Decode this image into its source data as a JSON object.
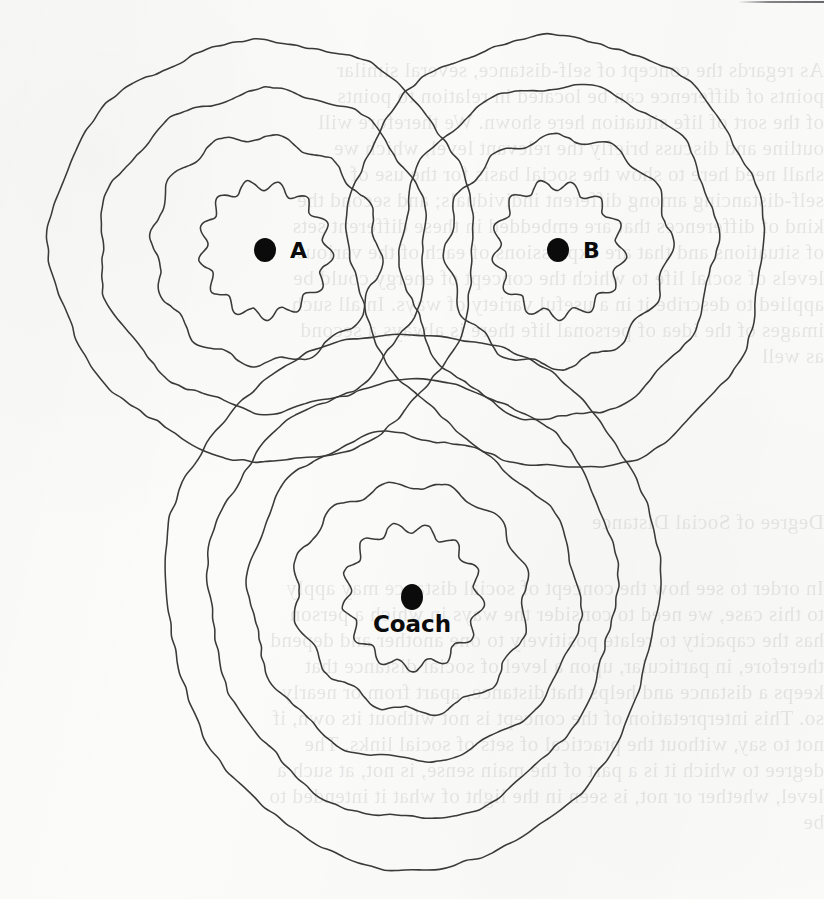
{
  "figure": {
    "kind": "contour-map-diagram",
    "caption": "",
    "background_color": "#fbfbfa",
    "line_color": "#3a3a3a",
    "dot_color": "#0b0b0b",
    "width": 824,
    "height": 899
  },
  "peaks": [
    {
      "id": "a",
      "label": "A",
      "label_position": "right",
      "center": {
        "x": 265,
        "y": 250
      },
      "dot_rx": 11,
      "dot_ry": 12,
      "ring_count": 4,
      "ring_radii": [
        62,
        112,
        160,
        208
      ]
    },
    {
      "id": "b",
      "label": "B",
      "label_position": "right",
      "center": {
        "x": 558,
        "y": 250
      },
      "dot_rx": 11,
      "dot_ry": 12,
      "ring_count": 4,
      "ring_radii": [
        62,
        112,
        160,
        208
      ]
    },
    {
      "id": "coach",
      "label": "Coach",
      "label_position": "below",
      "center": {
        "x": 412,
        "y": 597
      },
      "dot_rx": 11,
      "dot_ry": 13,
      "ring_count": 5,
      "ring_radii": [
        66,
        114,
        162,
        208,
        252
      ]
    }
  ],
  "bleed_text": {
    "description": "faint mirrored text showing through from the reverse side of the page",
    "color": "#b9b9bd",
    "right_column_top": [
      "As regards the concept of self-distance, several similar",
      "points of difference can be located in relation to points",
      "of the sort of life situation here shown. We therefore will",
      "outline and discuss briefly the relevant level, which we",
      "shall need here to show the social basis for the use of",
      "self-distancing among different individuals; and second the",
      "kind of differences that are embedded in these different sets",
      "of situations and that are expressions of each of the various",
      "levels of social life to which the concept of energy could be",
      "applied to describe it in a useful variety of ways. In all such",
      "images of the idea of personal life there is always a second",
      "as well"
    ],
    "right_column_mid": [
      "Degree of Social Distance"
    ],
    "right_column_bottom": [
      "In order to see how the concept of social distance may apply",
      "to this case, we need to consider the ways in which a person",
      "has the capacity to relate positively to one another and depend",
      "therefore, in particular, upon a level of social distance that",
      "keeps a distance and helps that distance, apart from or nearly",
      "so. This interpretation of the concept is not without its own, if",
      "not to say, without the practical of sets of social links. The",
      "degree to which it is a part of the main sense, is not, at such a",
      "level, whether or not, is seen in the light of what it intended to",
      "be"
    ]
  }
}
